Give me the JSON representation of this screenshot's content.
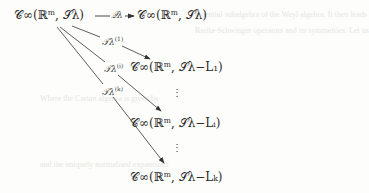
{
  "diagram": {
    "nodes": {
      "source": "𝒞∞(ℝᵐ, 𝒮λ)",
      "target_top": "𝒞∞(ℝᵐ, 𝒮λ)",
      "target_1": "𝒞∞(ℝᵐ, 𝒮λ−L₁)",
      "target_i": "𝒞∞(ℝᵐ, 𝒮λ−Lᵢ)",
      "target_k": "𝒞∞(ℝᵐ, 𝒮λ−Lₖ)"
    },
    "arrows": {
      "top": "𝒬λ",
      "to_1": "𝒯λ",
      "to_1_sup": "(1)",
      "to_i": "𝒯λ",
      "to_i_sup": "(i)",
      "to_k": "𝒯λ",
      "to_k_sup": "(k)"
    },
    "ellipsis": "⋮"
  },
  "bleed_through": [
    "essential subalgebra of the Weyl algebra. It then leads",
    "Rarita-Schwinger operators and its symmetries. Let us",
    "Where the Cartan algebra is given by",
    "and the uniquely normalised expansions"
  ],
  "colors": {
    "ink": "#2a2a2a",
    "background": "#fdfdfb"
  }
}
